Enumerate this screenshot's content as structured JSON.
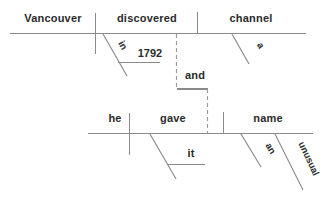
{
  "diagram": {
    "type": "reed-kellogg-sentence-diagram",
    "sentence": "Vancouver discovered a channel in 1792 and he gave it an unusual name",
    "conjunction": "and",
    "clauses": [
      {
        "id": "clause-upper",
        "subject": "Vancouver",
        "verb": "discovered",
        "object": "channel",
        "object_article": "a",
        "modifiers": [
          {
            "word": "in",
            "type": "preposition"
          },
          {
            "word": "1792",
            "type": "object-of-preposition"
          }
        ]
      },
      {
        "id": "clause-lower",
        "subject": "he",
        "verb": "gave",
        "object": "name",
        "object_article": "an",
        "object_adjective": "unusual",
        "modifiers": [
          {
            "word": "it",
            "type": "indirect-object"
          }
        ]
      }
    ]
  },
  "labels": {
    "upper": {
      "subject": "Vancouver",
      "verb": "discovered",
      "object": "channel",
      "prep": "in",
      "prep_object": "1792",
      "article": "a"
    },
    "conjunction": "and",
    "lower": {
      "subject": "he",
      "verb": "gave",
      "object": "name",
      "indirect_object": "it",
      "article": "an",
      "adjective": "unusual"
    }
  },
  "colors": {
    "background": "#ffffff",
    "line": "#8a8a8a",
    "dashed_line": "#9a9a9a",
    "text": "#2b2b2b"
  }
}
